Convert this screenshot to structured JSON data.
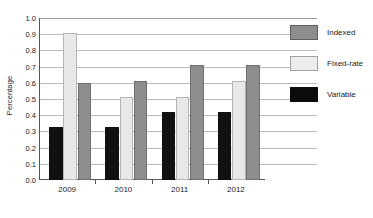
{
  "chart_data": {
    "type": "bar",
    "title": "",
    "xlabel": "",
    "ylabel": "Percentage",
    "categories": [
      "2009",
      "2010",
      "2011",
      "2012"
    ],
    "ylim": [
      0.0,
      1.0
    ],
    "ytick_labels": [
      "0.0",
      "0.1",
      "0.2",
      "0.3",
      "0.4",
      "0.5",
      "0.6",
      "0.7",
      "0.8",
      "0.9",
      "1.0"
    ],
    "ytick_values": [
      0.0,
      0.1,
      0.2,
      0.3,
      0.4,
      0.5,
      0.6,
      0.7,
      0.8,
      0.9,
      1.0
    ],
    "grid": true,
    "legend_position": "right",
    "series": [
      {
        "name": "Variable",
        "color": "#0c0c0c",
        "values": [
          0.33,
          0.33,
          0.42,
          0.42
        ]
      },
      {
        "name": "Fixed-rate",
        "color": "#ececeb",
        "values": [
          0.91,
          0.51,
          0.51,
          0.61
        ]
      },
      {
        "name": "Indexed",
        "color": "#8d8f8f",
        "values": [
          0.6,
          0.61,
          0.71,
          0.71
        ]
      }
    ],
    "series_draw_order": [
      "Variable",
      "Fixed-rate",
      "Indexed"
    ],
    "legend_order": [
      "Indexed",
      "Fixed-rate",
      "Variable"
    ]
  }
}
